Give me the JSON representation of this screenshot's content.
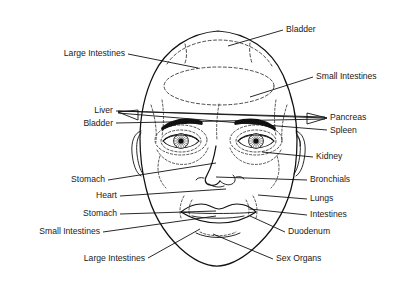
{
  "diagram": {
    "colors": {
      "ink": "#111111",
      "zone": "#2b2b2b",
      "background": "#ffffff"
    },
    "labels": [
      {
        "id": "bladder-top",
        "text": "Bladder",
        "side": "right",
        "x": 286,
        "y": 30,
        "line": [
          [
            283,
            30
          ],
          [
            228,
            46
          ]
        ]
      },
      {
        "id": "large-intestines-top",
        "text": "Large Intestines",
        "side": "left",
        "x": 125,
        "y": 54,
        "line": [
          [
            128,
            54
          ],
          [
            198,
            68
          ]
        ]
      },
      {
        "id": "small-intestines-right",
        "text": "Small Intestines",
        "side": "right",
        "x": 316,
        "y": 77,
        "line": [
          [
            313,
            77
          ],
          [
            250,
            97
          ]
        ]
      },
      {
        "id": "liver",
        "text": "Liver",
        "side": "left",
        "x": 113,
        "y": 111,
        "line": [
          [
            116,
            111
          ],
          [
            325,
            118
          ]
        ]
      },
      {
        "id": "bladder-left",
        "text": "Bladder",
        "side": "left",
        "x": 113,
        "y": 124,
        "line": [
          [
            116,
            123
          ],
          [
            325,
            118
          ]
        ]
      },
      {
        "id": "pancreas",
        "text": "Pancreas",
        "side": "right",
        "x": 330,
        "y": 118,
        "line": [
          [
            327,
            118
          ],
          [
            118,
            112
          ]
        ]
      },
      {
        "id": "spleen",
        "text": "Spleen",
        "side": "right",
        "x": 330,
        "y": 131,
        "line": [
          [
            327,
            130
          ],
          [
            118,
            112
          ]
        ]
      },
      {
        "id": "kidney",
        "text": "Kidney",
        "side": "right",
        "x": 316,
        "y": 157,
        "line": [
          [
            313,
            157
          ],
          [
            262,
            152
          ]
        ]
      },
      {
        "id": "stomach-upper",
        "text": "Stomach",
        "side": "left",
        "x": 105,
        "y": 180,
        "line": [
          [
            108,
            180
          ],
          [
            216,
            163
          ]
        ]
      },
      {
        "id": "bronchials",
        "text": "Bronchials",
        "side": "right",
        "x": 310,
        "y": 180,
        "line": [
          [
            307,
            180
          ],
          [
            215,
            177
          ]
        ]
      },
      {
        "id": "heart",
        "text": "Heart",
        "side": "left",
        "x": 117,
        "y": 196,
        "line": [
          [
            120,
            196
          ],
          [
            226,
            189
          ]
        ]
      },
      {
        "id": "lungs",
        "text": "Lungs",
        "side": "right",
        "x": 310,
        "y": 199,
        "line": [
          [
            307,
            199
          ],
          [
            258,
            195
          ]
        ]
      },
      {
        "id": "stomach-lower",
        "text": "Stomach",
        "side": "left",
        "x": 117,
        "y": 214,
        "line": [
          [
            120,
            214
          ],
          [
            215,
            211
          ]
        ]
      },
      {
        "id": "intestines",
        "text": "Intestines",
        "side": "right",
        "x": 310,
        "y": 215,
        "line": [
          [
            307,
            215
          ],
          [
            250,
            209
          ]
        ]
      },
      {
        "id": "small-intestines-left",
        "text": "Small Intestines",
        "side": "left",
        "x": 100,
        "y": 232,
        "line": [
          [
            103,
            232
          ],
          [
            216,
            216
          ]
        ]
      },
      {
        "id": "duodenum",
        "text": "Duodenum",
        "side": "right",
        "x": 288,
        "y": 232,
        "line": [
          [
            285,
            232
          ],
          [
            248,
            218
          ]
        ]
      },
      {
        "id": "large-intestines-bottom",
        "text": "Large Intestines",
        "side": "left",
        "x": 145,
        "y": 259,
        "line": [
          [
            148,
            258
          ],
          [
            200,
            229
          ]
        ]
      },
      {
        "id": "sex-organs",
        "text": "Sex Organs",
        "side": "right",
        "x": 276,
        "y": 259,
        "line": [
          [
            273,
            259
          ],
          [
            213,
            234
          ]
        ]
      }
    ],
    "features": [
      {
        "name": "head-outline",
        "interactable": false
      },
      {
        "name": "left-ear",
        "interactable": false
      },
      {
        "name": "right-ear",
        "interactable": false
      },
      {
        "name": "left-eye",
        "interactable": false
      },
      {
        "name": "right-eye",
        "interactable": false
      },
      {
        "name": "left-eyebrow",
        "interactable": false
      },
      {
        "name": "right-eyebrow",
        "interactable": false
      },
      {
        "name": "nose",
        "interactable": false
      },
      {
        "name": "mouth",
        "interactable": false
      },
      {
        "name": "chin",
        "interactable": false
      }
    ],
    "zones": [
      {
        "name": "forehead-upper-zone"
      },
      {
        "name": "forehead-mid-oval-zone"
      },
      {
        "name": "left-temple-zone"
      },
      {
        "name": "right-temple-zone"
      },
      {
        "name": "left-eye-zone"
      },
      {
        "name": "right-eye-zone"
      },
      {
        "name": "left-cheek-zone"
      },
      {
        "name": "right-cheek-zone"
      },
      {
        "name": "left-mouth-zone"
      },
      {
        "name": "right-mouth-zone"
      }
    ]
  }
}
